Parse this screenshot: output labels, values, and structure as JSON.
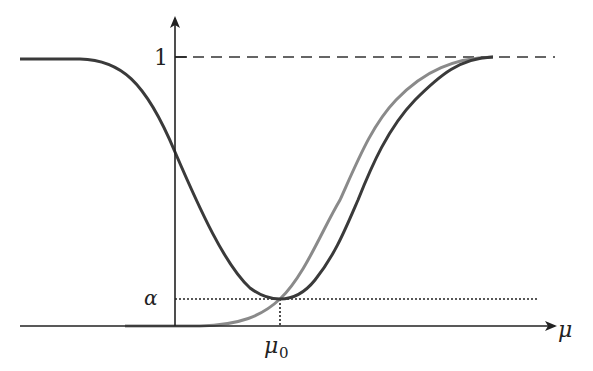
{
  "diagram": {
    "y_tick_one": "1",
    "alpha_label": "α",
    "x_axis_label": "μ",
    "mu0_label": "μ",
    "mu0_sub": "0",
    "colors": {
      "axes": "#222222",
      "two_sided_curve": "#3a3a3a",
      "one_sided_curve": "#8a8a8a"
    },
    "curves": [
      {
        "name": "two-sided power",
        "shape": "U",
        "min_at": "μ0",
        "min_value": "α",
        "asymptote": "1"
      },
      {
        "name": "one-sided power",
        "shape": "S",
        "passes": "(μ0, α)",
        "asymptote": "1"
      }
    ]
  }
}
